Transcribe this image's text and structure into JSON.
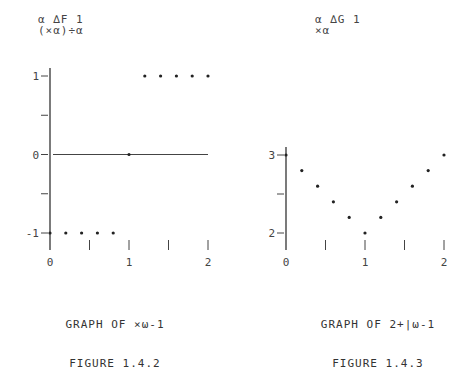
{
  "chart_data": [
    {
      "type": "scatter",
      "code_lines": [
        "α ∆F 1",
        "(×α)÷α"
      ],
      "code_function_name": "∆F",
      "caption_line1": "GRAPH OF ×ω-1",
      "caption_line2": "FIGURE 1.4.2",
      "xlabel": "",
      "ylabel": "",
      "xlim": [
        0,
        2
      ],
      "ylim": [
        -1,
        1
      ],
      "x_ticks": [
        0,
        0.5,
        1,
        1.5,
        2
      ],
      "x_tick_labels": [
        "0",
        "",
        "1",
        "",
        "2"
      ],
      "y_ticks": [
        -1,
        -0.5,
        0,
        0.5,
        1
      ],
      "y_tick_labels": [
        "-1",
        "",
        "0",
        "",
        "1"
      ],
      "grid": false,
      "horizontal_line": {
        "y": 0,
        "x_from": 0,
        "x_to": 2
      },
      "points": {
        "x": [
          0,
          0.2,
          0.4,
          0.6,
          0.8,
          1.0,
          1.2,
          1.4,
          1.6,
          1.8,
          2.0
        ],
        "y": [
          -1,
          -1,
          -1,
          -1,
          -1,
          0,
          1,
          1,
          1,
          1,
          1
        ]
      }
    },
    {
      "type": "scatter",
      "code_lines": [
        "α ∆G 1",
        "×α"
      ],
      "code_function_name": "∆G",
      "caption_line1": "GRAPH OF 2+|ω-1",
      "caption_line2": "FIGURE 1.4.3",
      "xlabel": "",
      "ylabel": "",
      "xlim": [
        0,
        2
      ],
      "ylim": [
        2,
        3
      ],
      "x_ticks": [
        0,
        0.5,
        1,
        1.5,
        2
      ],
      "x_tick_labels": [
        "0",
        "",
        "1",
        "",
        "2"
      ],
      "y_ticks": [
        2,
        2.5,
        3
      ],
      "y_tick_labels": [
        "2",
        "",
        "3"
      ],
      "grid": false,
      "points": {
        "x": [
          0,
          0.2,
          0.4,
          0.6,
          0.8,
          1.0,
          1.2,
          1.4,
          1.6,
          1.8,
          2.0
        ],
        "y": [
          3,
          2.8,
          2.6,
          2.4,
          2.2,
          2.0,
          2.2,
          2.4,
          2.6,
          2.8,
          3.0
        ]
      }
    }
  ]
}
